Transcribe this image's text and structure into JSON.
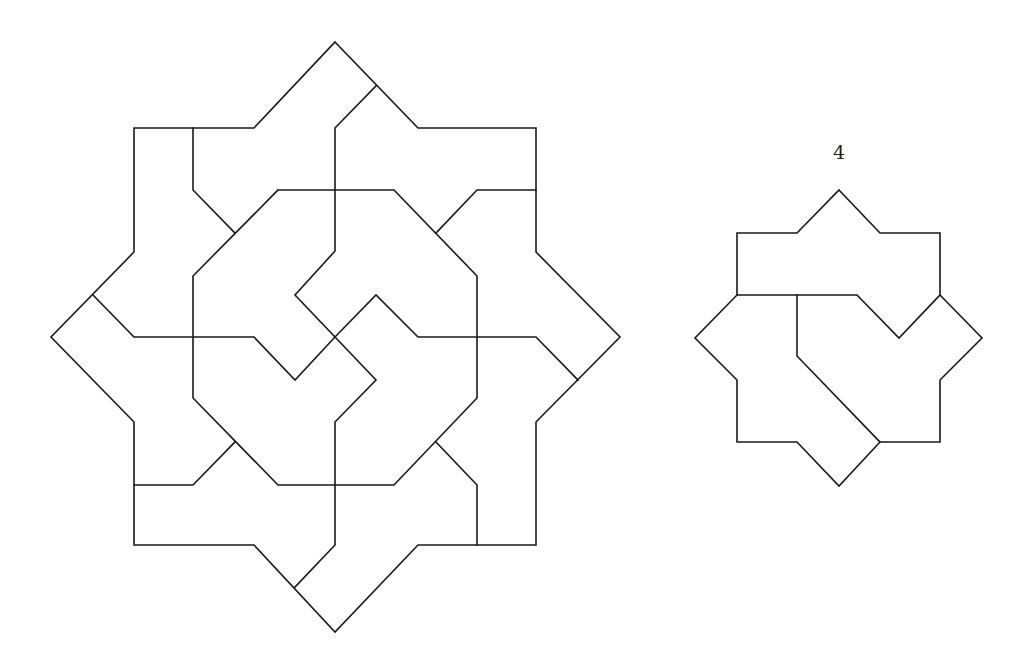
{
  "canvas": {
    "width": 1036,
    "height": 669,
    "background": "#ffffff",
    "stroke_color": "#1a1a1a"
  },
  "figures": [
    {
      "name": "large-star-tiling",
      "label": "",
      "outline": [
        [
          335,
          42
        ],
        [
          418,
          128
        ],
        [
          536,
          128
        ],
        [
          536,
          252
        ],
        [
          620,
          337
        ],
        [
          536,
          422
        ],
        [
          536,
          545
        ],
        [
          418,
          545
        ],
        [
          335,
          632
        ],
        [
          254,
          545
        ],
        [
          134,
          545
        ],
        [
          134,
          422
        ],
        [
          51,
          337
        ],
        [
          134,
          252
        ],
        [
          134,
          128
        ],
        [
          254,
          128
        ],
        [
          335,
          42
        ]
      ],
      "inner_lines": [
        [
          [
            278,
            190
          ],
          [
            394,
            190
          ],
          [
            477,
            276
          ],
          [
            477,
            398
          ],
          [
            394,
            485
          ],
          [
            278,
            485
          ],
          [
            193,
            398
          ],
          [
            193,
            276
          ],
          [
            278,
            190
          ]
        ],
        [
          [
            193,
            128
          ],
          [
            193,
            190
          ],
          [
            235,
            233
          ]
        ],
        [
          [
            376,
            86
          ],
          [
            335,
            128
          ],
          [
            335,
            251
          ],
          [
            295,
            295
          ],
          [
            335,
            337
          ],
          [
            376,
            380
          ],
          [
            335,
            422
          ],
          [
            335,
            545
          ],
          [
            295,
            587
          ]
        ],
        [
          [
            93,
            295
          ],
          [
            134,
            337
          ],
          [
            254,
            337
          ],
          [
            295,
            380
          ],
          [
            335,
            337
          ],
          [
            376,
            295
          ],
          [
            418,
            337
          ],
          [
            536,
            337
          ],
          [
            578,
            380
          ]
        ],
        [
          [
            536,
            190
          ],
          [
            477,
            190
          ],
          [
            436,
            233
          ]
        ],
        [
          [
            436,
            442
          ],
          [
            477,
            485
          ],
          [
            477,
            545
          ]
        ],
        [
          [
            134,
            485
          ],
          [
            193,
            485
          ],
          [
            235,
            442
          ]
        ]
      ]
    },
    {
      "name": "small-star-piece-4",
      "label": "4",
      "label_position": [
        839,
        152
      ],
      "outline": [
        [
          839,
          190
        ],
        [
          880,
          233
        ],
        [
          940,
          233
        ],
        [
          940,
          295
        ],
        [
          982,
          338
        ],
        [
          940,
          380
        ],
        [
          940,
          442
        ],
        [
          880,
          442
        ],
        [
          839,
          486
        ],
        [
          797,
          442
        ],
        [
          737,
          442
        ],
        [
          737,
          380
        ],
        [
          695,
          338
        ],
        [
          737,
          295
        ],
        [
          737,
          233
        ],
        [
          797,
          233
        ],
        [
          839,
          190
        ]
      ],
      "inner_lines": [
        [
          [
            737,
            295
          ],
          [
            797,
            295
          ],
          [
            857,
            295
          ],
          [
            899,
            338
          ],
          [
            940,
            295
          ]
        ],
        [
          [
            797,
            295
          ],
          [
            797,
            356
          ],
          [
            880,
            442
          ]
        ]
      ]
    }
  ]
}
